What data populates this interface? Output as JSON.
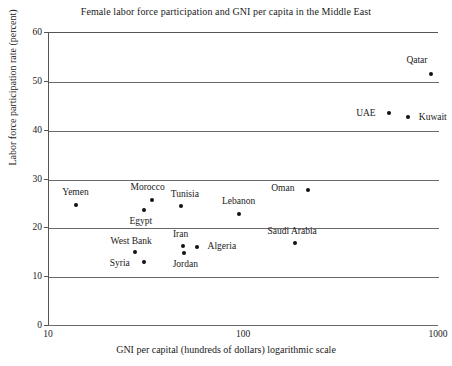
{
  "chart_data": {
    "type": "scatter",
    "title": "Female labor force participation and GNI per capita in the Middle East",
    "xlabel": "GNI per capital (hundreds of dollars) logarithmic scale",
    "ylabel": "Labor force participation rate (percent)",
    "xscale": "log",
    "xlim": [
      10,
      1000
    ],
    "ylim": [
      0,
      60
    ],
    "xticks": [
      "10",
      "100",
      "1000"
    ],
    "xtick_values": [
      10,
      100,
      1000
    ],
    "yticks": [
      "0",
      "10",
      "20",
      "30",
      "40",
      "50",
      "60"
    ],
    "ytick_values": [
      0,
      10,
      20,
      30,
      40,
      50,
      60
    ],
    "grid": "horizontal",
    "legend": "none",
    "marker_color": "#111111",
    "axis_color": "#6a6a6a",
    "points": [
      {
        "name": "Yemen",
        "x": 14,
        "y": 24.5,
        "label_dx": -1,
        "label_dy": -13
      },
      {
        "name": "Morocco",
        "x": 34,
        "y": 25.6,
        "label_dx": -4,
        "label_dy": -13
      },
      {
        "name": "Egypt",
        "x": 31,
        "y": 23.5,
        "label_dx": -3,
        "label_dy": 11
      },
      {
        "name": "Tunisia",
        "x": 48,
        "y": 24.4,
        "label_dx": 4,
        "label_dy": -12
      },
      {
        "name": "Lebanon",
        "x": 95,
        "y": 22.8,
        "label_dx": 0,
        "label_dy": -13
      },
      {
        "name": "Oman",
        "x": 215,
        "y": 27.6,
        "label_dx": -25,
        "label_dy": -2
      },
      {
        "name": "Saudi Arabia",
        "x": 185,
        "y": 16.8,
        "label_dx": -3,
        "label_dy": -12
      },
      {
        "name": "West Bank",
        "x": 28,
        "y": 15.0,
        "label_dx": -4,
        "label_dy": -11
      },
      {
        "name": "Syria",
        "x": 31,
        "y": 13.0,
        "label_dx": -24,
        "label_dy": 1
      },
      {
        "name": "Iran",
        "x": 49,
        "y": 16.2,
        "label_dx": -2,
        "label_dy": -12
      },
      {
        "name": "Jordan",
        "x": 50,
        "y": 14.8,
        "label_dx": 1,
        "label_dy": 11
      },
      {
        "name": "Algeria",
        "x": 58,
        "y": 15.9,
        "label_dx": 25,
        "label_dy": -1
      },
      {
        "name": "UAE",
        "x": 560,
        "y": 43.5,
        "label_dx": -23,
        "label_dy": 0
      },
      {
        "name": "Kuwait",
        "x": 700,
        "y": 42.6,
        "label_dx": 25,
        "label_dy": 0
      },
      {
        "name": "Qatar",
        "x": 920,
        "y": 51.5,
        "label_dx": -14,
        "label_dy": -14
      }
    ]
  }
}
